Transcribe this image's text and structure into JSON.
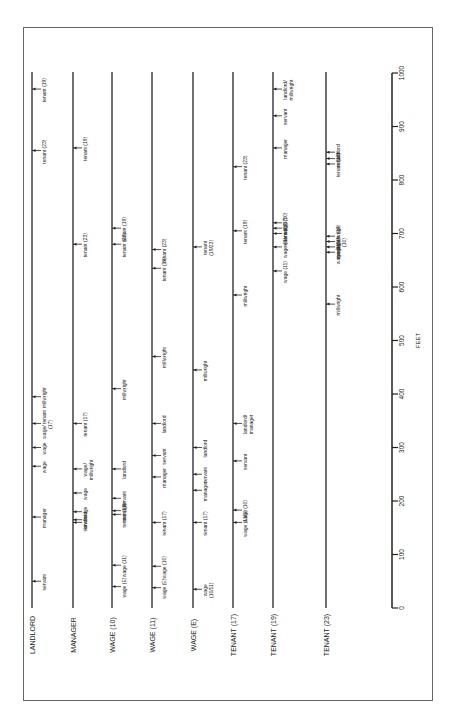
{
  "page": {
    "number": ""
  },
  "chart_data": {
    "type": "timeline",
    "title": "",
    "axis": {
      "label": "FEET",
      "min": 0,
      "max": 1000,
      "ticks": [
        0,
        100,
        200,
        300,
        400,
        500,
        600,
        700,
        800,
        900,
        1000
      ]
    },
    "rows": [
      {
        "label": "LANDLORD",
        "marks": [
          {
            "ft": 50,
            "text": "servant"
          },
          {
            "ft": 170,
            "text": "manager"
          },
          {
            "ft": 265,
            "text": "wage"
          },
          {
            "ft": 300,
            "text": "wage"
          },
          {
            "ft": 345,
            "text": "wage/ tenant (17)"
          },
          {
            "ft": 395,
            "text": "millwright"
          },
          {
            "ft": 855,
            "text": "tenant (23)"
          },
          {
            "ft": 970,
            "text": "tenant (19)"
          }
        ]
      },
      {
        "label": "MANAGER",
        "marks": [
          {
            "ft": 160,
            "text": "servant"
          },
          {
            "ft": 165,
            "text": "landlord"
          },
          {
            "ft": 180,
            "text": "wage"
          },
          {
            "ft": 215,
            "text": "wage"
          },
          {
            "ft": 260,
            "text": "wage/ millwright"
          },
          {
            "ft": 345,
            "text": "tenant (17)"
          },
          {
            "ft": 680,
            "text": "tenant (23)"
          },
          {
            "ft": 860,
            "text": "tenant (19)"
          }
        ]
      },
      {
        "label": "WAGE (10)",
        "marks": [
          {
            "ft": 40,
            "text": "wage (E)"
          },
          {
            "ft": 80,
            "text": "wage (11)"
          },
          {
            "ft": 175,
            "text": "tenant (17)"
          },
          {
            "ft": 182,
            "text": "manager"
          },
          {
            "ft": 205,
            "text": "servant"
          },
          {
            "ft": 260,
            "text": "landlord"
          },
          {
            "ft": 410,
            "text": "millwright"
          },
          {
            "ft": 680,
            "text": "tenant (23)"
          },
          {
            "ft": 710,
            "text": "tenant (19)"
          }
        ]
      },
      {
        "label": "WAGE (11)",
        "marks": [
          {
            "ft": 38,
            "text": "wage (E)"
          },
          {
            "ft": 78,
            "text": "wage (10)"
          },
          {
            "ft": 160,
            "text": "tenant (17)"
          },
          {
            "ft": 245,
            "text": "manager"
          },
          {
            "ft": 285,
            "text": "servant"
          },
          {
            "ft": 345,
            "text": "landlord"
          },
          {
            "ft": 470,
            "text": "millwright"
          },
          {
            "ft": 635,
            "text": "tenant (19)"
          },
          {
            "ft": 670,
            "text": "tenant (23)"
          }
        ]
      },
      {
        "label": "WAGE (E)",
        "marks": [
          {
            "ft": 35,
            "text": "wage (10/11)"
          },
          {
            "ft": 160,
            "text": "tenant (17)"
          },
          {
            "ft": 220,
            "text": "manager"
          },
          {
            "ft": 250,
            "text": "servant"
          },
          {
            "ft": 300,
            "text": "landlord"
          },
          {
            "ft": 445,
            "text": "millwright"
          },
          {
            "ft": 675,
            "text": "tenant (19/23)"
          }
        ]
      },
      {
        "label": "TENANT (17)",
        "marks": [
          {
            "ft": 160,
            "text": "wage (11/E)"
          },
          {
            "ft": 183,
            "text": "wage (10)"
          },
          {
            "ft": 275,
            "text": "servant"
          },
          {
            "ft": 345,
            "text": "landlord/ manager"
          },
          {
            "ft": 585,
            "text": "millwright"
          },
          {
            "ft": 705,
            "text": "tenant (19)"
          },
          {
            "ft": 825,
            "text": "tenant (23)"
          }
        ]
      },
      {
        "label": "TENANT (19)",
        "marks": [
          {
            "ft": 630,
            "text": "wage (11)"
          },
          {
            "ft": 675,
            "text": "wage (E)"
          },
          {
            "ft": 700,
            "text": "tenant (23)"
          },
          {
            "ft": 710,
            "text": "tenant (17)"
          },
          {
            "ft": 720,
            "text": "wage (10)"
          },
          {
            "ft": 860,
            "text": "manager"
          },
          {
            "ft": 920,
            "text": "servant"
          },
          {
            "ft": 970,
            "text": "landlord/ millwright"
          }
        ]
      },
      {
        "label": "TENANT (23)",
        "marks": [
          {
            "ft": 568,
            "text": "millwright"
          },
          {
            "ft": 665,
            "text": "wage (11)"
          },
          {
            "ft": 675,
            "text": "wage (E)"
          },
          {
            "ft": 685,
            "text": "manager/wage (10)"
          },
          {
            "ft": 695,
            "text": "tenant (19)"
          },
          {
            "ft": 830,
            "text": "tenant (17)"
          },
          {
            "ft": 840,
            "text": "servant"
          },
          {
            "ft": 852,
            "text": "landlord"
          }
        ]
      }
    ],
    "layout": {
      "orientation": "rotated 90deg, rows vertical, feet increase upward",
      "grid": false,
      "legend": "none"
    }
  }
}
